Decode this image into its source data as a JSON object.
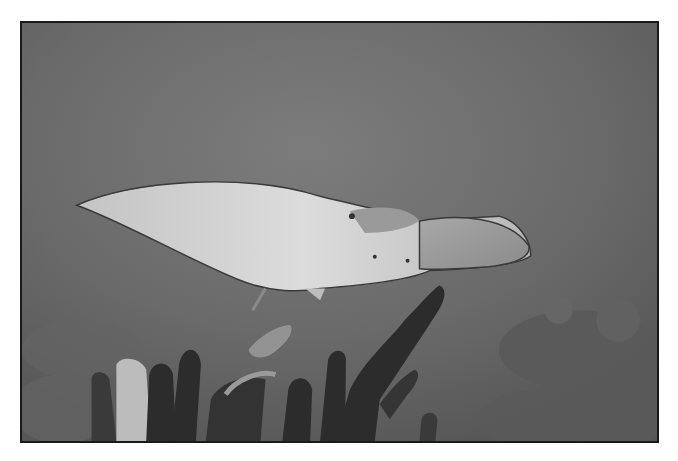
{
  "image": {
    "description": "Grayscale underwater photograph of a spotted eagle ray gliding above pillar coral formations on a reef",
    "subjects": [
      "eagle ray",
      "pillar coral",
      "coral reef"
    ],
    "palette": {
      "water": "#6e6e6e",
      "ray_body": "#cfcfcf",
      "coral_dark": "#2a2a2a",
      "coral_light": "#bdbdbd",
      "reef_right": "#555555",
      "border": "#1a1a1a",
      "background": "#ffffff"
    }
  }
}
